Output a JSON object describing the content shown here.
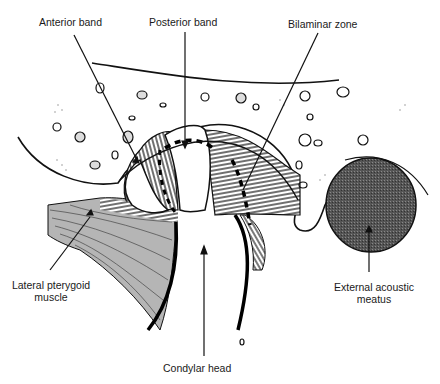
{
  "diagram": {
    "colors": {
      "ink": "#111111",
      "muscle_fill": "#b5b5b5",
      "meatus_fill": "#4a4a4a",
      "background": "#ffffff"
    },
    "labels": {
      "anterior_band": "Anterior band",
      "posterior_band": "Posterior band",
      "bilaminar_zone": "Bilaminar zone",
      "lateral_pterygoid_line1": "Lateral pterygoid",
      "lateral_pterygoid_line2": "muscle",
      "external_acoustic_line1": "External acoustic",
      "external_acoustic_line2": "meatus",
      "condylar_head": "Condylar head"
    }
  }
}
